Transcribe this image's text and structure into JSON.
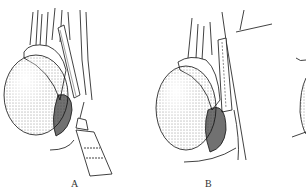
{
  "figure": {
    "panels": [
      {
        "label": "A",
        "content": "testis with epididymis, spermatic cord, syringe needle inserted"
      },
      {
        "label": "B",
        "content": "testis with epididymis and cord, suture thread"
      }
    ],
    "partial_panel_visible": true
  }
}
